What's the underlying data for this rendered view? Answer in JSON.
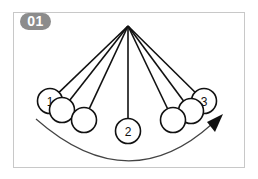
{
  "figure": {
    "badge": {
      "label": "01",
      "color": "#8c8c8c"
    },
    "frame_border_color": "#c8c8c8",
    "pivot": {
      "x": 128,
      "y": 26
    },
    "ball_radius": 12.5,
    "balls": [
      {
        "x": 50,
        "y": 101,
        "label": "1"
      },
      {
        "x": 62,
        "y": 110,
        "label": ""
      },
      {
        "x": 84,
        "y": 120,
        "label": ""
      },
      {
        "x": 128,
        "y": 131,
        "label": "2"
      },
      {
        "x": 173,
        "y": 120,
        "label": ""
      },
      {
        "x": 191,
        "y": 111,
        "label": ""
      },
      {
        "x": 204,
        "y": 101,
        "label": "3"
      }
    ],
    "motion_arc": {
      "direction": "left-to-right",
      "color": "#444444"
    }
  }
}
